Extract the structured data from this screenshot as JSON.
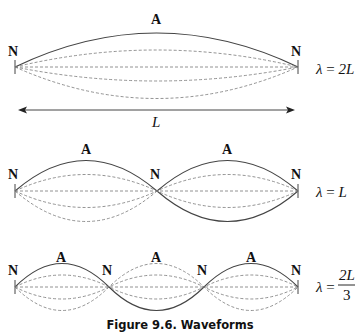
{
  "figure": {
    "caption": "Figure 9.6.  Waveforms",
    "diagrams": [
      {
        "node_label": "N",
        "antinode_label": "A",
        "length_label": "L",
        "equation_lambda": "λ",
        "equation_eq": " = ",
        "equation_value": "2L"
      },
      {
        "node_label": "N",
        "antinode_label": "A",
        "equation_lambda": "λ",
        "equation_eq": " = ",
        "equation_value": "L"
      },
      {
        "node_label": "N",
        "antinode_label": "A",
        "equation_lambda": "λ",
        "equation_eq": " = ",
        "equation_num": "2L",
        "equation_den": "3"
      }
    ]
  }
}
